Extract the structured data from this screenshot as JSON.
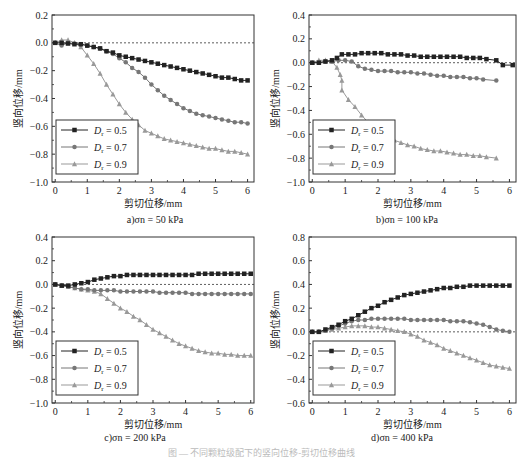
{
  "figure_caption": "图 — 不同颗粒级配下的竖向位移-剪切位移曲线",
  "chart_data": [
    {
      "type": "line",
      "panel": "a",
      "caption": "a)σn = 50 kPa",
      "xlabel": "剪切位移/mm",
      "ylabel": "竖向位移/mm",
      "xlim": [
        -0.1,
        6.2
      ],
      "ylim": [
        -1.0,
        0.2
      ],
      "xticks": [
        0,
        1,
        2,
        3,
        4,
        5,
        6
      ],
      "yticks": [
        0.2,
        0.0,
        -0.2,
        -0.4,
        -0.6,
        -0.8,
        -1.0
      ],
      "ytick_labels": [
        "0.2",
        "0.0",
        "-0.2",
        "-0.4",
        "-0.6",
        "-0.8",
        "-1.0"
      ],
      "reference_line": 0.0,
      "legend_position": "lower left",
      "series": [
        {
          "name": "Dr = 0.5",
          "marker": "square",
          "color": "#222222",
          "x": [
            0,
            0.2,
            0.4,
            0.6,
            0.8,
            1.0,
            1.2,
            1.4,
            1.6,
            1.8,
            2.0,
            2.2,
            2.4,
            2.6,
            2.8,
            3.0,
            3.2,
            3.4,
            3.6,
            3.8,
            4.0,
            4.2,
            4.4,
            4.6,
            4.8,
            5.0,
            5.2,
            5.4,
            5.6,
            5.8,
            6.0
          ],
          "y": [
            0,
            0.0,
            -0.005,
            -0.01,
            -0.01,
            -0.02,
            -0.03,
            -0.04,
            -0.06,
            -0.07,
            -0.09,
            -0.1,
            -0.11,
            -0.12,
            -0.13,
            -0.14,
            -0.15,
            -0.16,
            -0.17,
            -0.18,
            -0.19,
            -0.2,
            -0.21,
            -0.22,
            -0.23,
            -0.24,
            -0.25,
            -0.25,
            -0.26,
            -0.27,
            -0.27
          ]
        },
        {
          "name": "Dr = 0.7",
          "marker": "circle",
          "color": "#777777",
          "x": [
            0,
            0.2,
            0.4,
            0.6,
            0.8,
            1.0,
            1.2,
            1.4,
            1.6,
            1.8,
            2.0,
            2.2,
            2.4,
            2.6,
            2.8,
            3.0,
            3.2,
            3.4,
            3.6,
            3.8,
            4.0,
            4.2,
            4.4,
            4.6,
            4.8,
            5.0,
            5.2,
            5.4,
            5.6,
            5.8,
            6.0
          ],
          "y": [
            0,
            -0.02,
            0.0,
            -0.005,
            -0.01,
            -0.02,
            -0.03,
            -0.04,
            -0.06,
            -0.08,
            -0.11,
            -0.14,
            -0.18,
            -0.21,
            -0.25,
            -0.3,
            -0.34,
            -0.38,
            -0.41,
            -0.44,
            -0.47,
            -0.49,
            -0.51,
            -0.52,
            -0.53,
            -0.54,
            -0.55,
            -0.56,
            -0.57,
            -0.57,
            -0.58
          ]
        },
        {
          "name": "Dr = 0.9",
          "marker": "triangle",
          "color": "#999999",
          "x": [
            0,
            0.2,
            0.4,
            0.6,
            0.8,
            1.0,
            1.2,
            1.4,
            1.6,
            1.8,
            2.0,
            2.2,
            2.4,
            2.6,
            2.8,
            3.0,
            3.2,
            3.4,
            3.6,
            3.8,
            4.0,
            4.2,
            4.4,
            4.6,
            4.8,
            5.0,
            5.2,
            5.4,
            5.6,
            5.8,
            6.0
          ],
          "y": [
            0,
            0.02,
            0.02,
            0.0,
            -0.03,
            -0.09,
            -0.15,
            -0.22,
            -0.3,
            -0.37,
            -0.44,
            -0.5,
            -0.55,
            -0.59,
            -0.63,
            -0.65,
            -0.67,
            -0.69,
            -0.7,
            -0.71,
            -0.72,
            -0.73,
            -0.74,
            -0.75,
            -0.76,
            -0.76,
            -0.77,
            -0.78,
            -0.78,
            -0.79,
            -0.8
          ]
        }
      ]
    },
    {
      "type": "line",
      "panel": "b",
      "caption": "b)σn = 100 kPa",
      "xlabel": "剪切位移/mm",
      "ylabel": "竖向位移/mm",
      "xlim": [
        -0.1,
        6.2
      ],
      "ylim": [
        -1.0,
        0.4
      ],
      "xticks": [
        0,
        1,
        2,
        3,
        4,
        5,
        6
      ],
      "yticks": [
        0.4,
        0.2,
        0.0,
        -0.2,
        -0.4,
        -0.6,
        -0.8,
        -1.0
      ],
      "ytick_labels": [
        "0.4",
        "0.2",
        "0.0",
        "-0.2",
        "-0.4",
        "-0.6",
        "-0.8",
        "-1.0"
      ],
      "reference_line": 0.0,
      "legend_position": "lower left",
      "series": [
        {
          "name": "Dr = 0.5",
          "marker": "square",
          "color": "#222222",
          "x": [
            0,
            0.2,
            0.4,
            0.6,
            0.75,
            0.9,
            1.1,
            1.3,
            1.5,
            1.7,
            1.9,
            2.1,
            2.3,
            2.5,
            2.7,
            2.9,
            3.1,
            3.3,
            3.5,
            3.7,
            3.9,
            4.1,
            4.3,
            4.5,
            4.7,
            4.9,
            5.1,
            5.3,
            5.6,
            5.8,
            6.1
          ],
          "y": [
            0,
            0.0,
            0.01,
            0.02,
            0.04,
            0.07,
            0.07,
            0.07,
            0.08,
            0.08,
            0.08,
            0.08,
            0.07,
            0.07,
            0.07,
            0.06,
            0.06,
            0.05,
            0.05,
            0.05,
            0.05,
            0.05,
            0.05,
            0.05,
            0.04,
            0.04,
            0.04,
            0.03,
            0.02,
            -0.02,
            -0.02
          ]
        },
        {
          "name": "Dr = 0.7",
          "marker": "circle",
          "color": "#777777",
          "x": [
            0,
            0.2,
            0.4,
            0.6,
            0.8,
            1.0,
            1.2,
            1.4,
            1.6,
            1.8,
            2.0,
            2.2,
            2.4,
            2.6,
            2.8,
            3.0,
            3.2,
            3.4,
            3.6,
            3.8,
            4.0,
            4.2,
            4.4,
            4.6,
            4.8,
            5.0,
            5.2,
            5.6
          ],
          "y": [
            0,
            0.0,
            0.01,
            0.01,
            0.02,
            0.02,
            0.01,
            -0.03,
            -0.05,
            -0.06,
            -0.07,
            -0.07,
            -0.07,
            -0.08,
            -0.08,
            -0.08,
            -0.09,
            -0.09,
            -0.1,
            -0.11,
            -0.11,
            -0.12,
            -0.12,
            -0.12,
            -0.13,
            -0.13,
            -0.14,
            -0.15
          ]
        },
        {
          "name": "Dr = 0.9",
          "marker": "triangle",
          "color": "#999999",
          "x": [
            0,
            0.2,
            0.4,
            0.6,
            0.75,
            0.85,
            0.9,
            0.9,
            1.1,
            1.3,
            1.5,
            1.7,
            1.9,
            2.1,
            2.3,
            2.5,
            2.7,
            2.9,
            3.1,
            3.3,
            3.5,
            3.7,
            3.9,
            4.1,
            4.3,
            4.5,
            4.7,
            4.9,
            5.1,
            5.3,
            5.6
          ],
          "y": [
            0,
            0.02,
            0.02,
            0.01,
            -0.04,
            -0.1,
            -0.15,
            -0.23,
            -0.31,
            -0.37,
            -0.44,
            -0.5,
            -0.55,
            -0.59,
            -0.62,
            -0.65,
            -0.67,
            -0.69,
            -0.7,
            -0.72,
            -0.73,
            -0.74,
            -0.74,
            -0.75,
            -0.76,
            -0.77,
            -0.77,
            -0.78,
            -0.78,
            -0.79,
            -0.8
          ]
        }
      ]
    },
    {
      "type": "line",
      "panel": "c",
      "caption": "c)σn = 200 kPa",
      "xlabel": "剪切位移/mm",
      "ylabel": "竖向位移/mm",
      "xlim": [
        -0.1,
        6.1
      ],
      "ylim": [
        -1.0,
        0.4
      ],
      "xticks": [
        0,
        1,
        2,
        3,
        4,
        5,
        6
      ],
      "yticks": [
        0.4,
        0.2,
        0.0,
        -0.2,
        -0.4,
        -0.6,
        -0.8,
        -1.0
      ],
      "ytick_labels": [
        "0.4",
        "0.2",
        "0.0",
        "-0.2",
        "-0.4",
        "-0.6",
        "-0.8",
        "-1.0"
      ],
      "reference_line": 0.0,
      "legend_position": "lower left",
      "series": [
        {
          "name": "Dr = 0.5",
          "marker": "square",
          "color": "#222222",
          "x": [
            0,
            0.2,
            0.4,
            0.6,
            0.8,
            1.0,
            1.2,
            1.4,
            1.6,
            1.8,
            2.0,
            2.2,
            2.4,
            2.6,
            2.8,
            3.0,
            3.2,
            3.4,
            3.6,
            3.8,
            4.0,
            4.2,
            4.4,
            4.6,
            4.8,
            5.0,
            5.2,
            5.4,
            5.6,
            5.8,
            6.0
          ],
          "y": [
            0,
            -0.01,
            -0.01,
            0.0,
            0.01,
            0.02,
            0.04,
            0.05,
            0.06,
            0.07,
            0.07,
            0.08,
            0.08,
            0.08,
            0.08,
            0.08,
            0.08,
            0.08,
            0.08,
            0.08,
            0.08,
            0.08,
            0.09,
            0.09,
            0.09,
            0.09,
            0.09,
            0.09,
            0.09,
            0.09,
            0.09
          ]
        },
        {
          "name": "Dr = 0.7",
          "marker": "circle",
          "color": "#777777",
          "x": [
            0,
            0.2,
            0.4,
            0.6,
            0.8,
            1.0,
            1.2,
            1.4,
            1.6,
            1.8,
            2.0,
            2.2,
            2.4,
            2.6,
            2.8,
            3.0,
            3.2,
            3.4,
            3.6,
            3.8,
            4.0,
            4.2,
            4.4,
            4.6,
            4.8,
            5.0,
            5.2,
            5.4,
            5.6,
            5.8,
            6.0
          ],
          "y": [
            0,
            -0.01,
            -0.02,
            -0.03,
            -0.04,
            -0.04,
            -0.05,
            -0.05,
            -0.05,
            -0.05,
            -0.06,
            -0.06,
            -0.06,
            -0.06,
            -0.06,
            -0.06,
            -0.07,
            -0.07,
            -0.07,
            -0.07,
            -0.07,
            -0.08,
            -0.08,
            -0.08,
            -0.08,
            -0.08,
            -0.08,
            -0.08,
            -0.08,
            -0.08,
            -0.08
          ]
        },
        {
          "name": "Dr = 0.9",
          "marker": "triangle",
          "color": "#999999",
          "x": [
            0,
            0.2,
            0.4,
            0.6,
            0.8,
            1.0,
            1.2,
            1.4,
            1.6,
            1.8,
            2.0,
            2.2,
            2.4,
            2.6,
            2.8,
            3.0,
            3.2,
            3.4,
            3.6,
            3.8,
            4.0,
            4.2,
            4.4,
            4.6,
            4.8,
            5.0,
            5.2,
            5.4,
            5.6,
            5.8,
            6.0
          ],
          "y": [
            0,
            -0.01,
            -0.02,
            -0.03,
            -0.04,
            -0.05,
            -0.06,
            -0.08,
            -0.12,
            -0.16,
            -0.2,
            -0.23,
            -0.27,
            -0.3,
            -0.34,
            -0.38,
            -0.41,
            -0.44,
            -0.47,
            -0.5,
            -0.52,
            -0.54,
            -0.56,
            -0.57,
            -0.58,
            -0.58,
            -0.59,
            -0.59,
            -0.6,
            -0.6,
            -0.6
          ]
        }
      ]
    },
    {
      "type": "line",
      "panel": "d",
      "caption": "d)σn = 400 kPa",
      "xlabel": "剪切位移/mm",
      "ylabel": "竖向位移/mm",
      "xlim": [
        -0.1,
        6.2
      ],
      "ylim": [
        -0.6,
        0.8
      ],
      "xticks": [
        0,
        1,
        2,
        3,
        4,
        5,
        6
      ],
      "yticks": [
        0.8,
        0.6,
        0.4,
        0.2,
        0.0,
        -0.2,
        -0.4,
        -0.6
      ],
      "ytick_labels": [
        "0.8",
        "0.6",
        "0.4",
        "0.2",
        "0.0",
        "-0.2",
        "-0.4",
        "-0.6"
      ],
      "reference_line": 0.0,
      "legend_position": "lower left",
      "series": [
        {
          "name": "Dr = 0.5",
          "marker": "square",
          "color": "#222222",
          "x": [
            0,
            0.2,
            0.4,
            0.6,
            0.8,
            1.0,
            1.2,
            1.4,
            1.6,
            1.8,
            2.0,
            2.2,
            2.4,
            2.6,
            2.8,
            3.0,
            3.2,
            3.4,
            3.6,
            3.8,
            4.0,
            4.2,
            4.4,
            4.6,
            4.8,
            5.0,
            5.2,
            5.4,
            5.6,
            5.8,
            6.0
          ],
          "y": [
            0,
            0.0,
            0.02,
            0.04,
            0.06,
            0.09,
            0.11,
            0.14,
            0.17,
            0.2,
            0.22,
            0.25,
            0.27,
            0.29,
            0.31,
            0.32,
            0.33,
            0.34,
            0.35,
            0.36,
            0.37,
            0.37,
            0.38,
            0.38,
            0.39,
            0.39,
            0.39,
            0.39,
            0.39,
            0.39,
            0.39
          ]
        },
        {
          "name": "Dr = 0.7",
          "marker": "circle",
          "color": "#777777",
          "x": [
            0,
            0.2,
            0.4,
            0.6,
            0.8,
            1.0,
            1.2,
            1.4,
            1.6,
            1.8,
            2.0,
            2.2,
            2.4,
            2.6,
            2.8,
            3.0,
            3.2,
            3.4,
            3.6,
            3.8,
            4.0,
            4.2,
            4.4,
            4.6,
            4.8,
            5.0,
            5.2,
            5.4,
            5.6,
            5.8,
            6.0
          ],
          "y": [
            0,
            0.0,
            0.01,
            0.03,
            0.05,
            0.07,
            0.09,
            0.1,
            0.1,
            0.11,
            0.11,
            0.11,
            0.11,
            0.11,
            0.11,
            0.1,
            0.1,
            0.1,
            0.1,
            0.1,
            0.1,
            0.09,
            0.09,
            0.09,
            0.08,
            0.07,
            0.06,
            0.04,
            0.02,
            0.01,
            0.0
          ]
        },
        {
          "name": "Dr = 0.9",
          "marker": "triangle",
          "color": "#999999",
          "x": [
            0,
            0.2,
            0.4,
            0.6,
            0.8,
            1.0,
            1.2,
            1.4,
            1.6,
            1.8,
            2.0,
            2.2,
            2.4,
            2.6,
            2.8,
            3.0,
            3.2,
            3.4,
            3.6,
            3.8,
            4.0,
            4.2,
            4.4,
            4.6,
            4.8,
            5.0,
            5.2,
            5.4,
            5.6,
            5.8,
            6.0
          ],
          "y": [
            0,
            0.0,
            0.01,
            0.02,
            0.03,
            0.04,
            0.05,
            0.05,
            0.05,
            0.04,
            0.04,
            0.03,
            0.02,
            0.01,
            0.0,
            -0.02,
            -0.04,
            -0.07,
            -0.09,
            -0.11,
            -0.14,
            -0.16,
            -0.18,
            -0.2,
            -0.22,
            -0.24,
            -0.26,
            -0.28,
            -0.29,
            -0.3,
            -0.31
          ]
        }
      ]
    }
  ]
}
